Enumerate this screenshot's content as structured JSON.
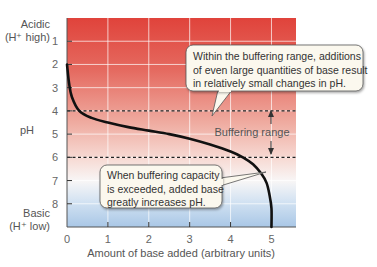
{
  "chart_data": {
    "type": "line",
    "title": "",
    "xlabel": "Amount of base added (arbitrary units)",
    "ylabel": "pH",
    "y_top_label": [
      "Acidic",
      "(H⁺ high)"
    ],
    "y_bottom_label": [
      "Basic",
      "(H⁺ low)"
    ],
    "xlim": [
      0,
      5.6
    ],
    "ylim": [
      0,
      9
    ],
    "y_inverted": true,
    "x_ticks": [
      0,
      1,
      2,
      3,
      4,
      5
    ],
    "y_ticks": [
      1,
      2,
      3,
      4,
      5,
      6,
      7,
      8
    ],
    "series": [
      {
        "name": "pH curve",
        "x": [
          0,
          0.05,
          0.12,
          0.3,
          0.6,
          1.0,
          1.5,
          2.0,
          2.5,
          3.0,
          3.5,
          4.0,
          4.3,
          4.55,
          4.75,
          4.88,
          4.95,
          5.0,
          5.0
        ],
        "y": [
          2.0,
          2.8,
          3.4,
          4.0,
          4.3,
          4.5,
          4.7,
          4.85,
          5.0,
          5.2,
          5.45,
          5.75,
          6.0,
          6.3,
          6.7,
          7.1,
          7.6,
          8.2,
          9.0
        ]
      }
    ],
    "buffering_range": {
      "ph_low": 4,
      "ph_high": 6,
      "label": "Buffering range"
    },
    "annotations": [
      {
        "id": "top",
        "lines": [
          "Within the buffering range, additions",
          "of even large quantities of base result",
          "in relatively small changes in pH."
        ]
      },
      {
        "id": "bottom",
        "lines": [
          "When buffering capacity",
          "is exceeded, added base",
          "greatly increases pH."
        ]
      }
    ],
    "background_gradient": {
      "acidic": "#e0433b",
      "neutral": "#fbf3f1",
      "basic": "#a9c7e6"
    },
    "grid": true
  }
}
